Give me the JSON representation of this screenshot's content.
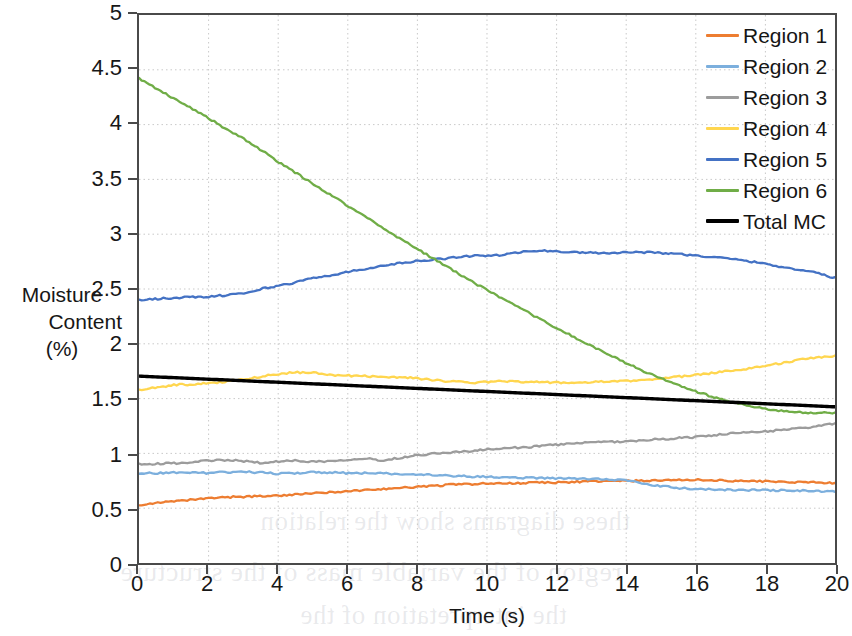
{
  "chart_data": {
    "type": "line",
    "title": "",
    "xlabel": "Time (s)",
    "ylabel": "Moisture Content (%)",
    "ylabel_lines": [
      "Moisture",
      "Content",
      "(%)"
    ],
    "xlim": [
      0,
      20
    ],
    "ylim": [
      0,
      5
    ],
    "xticks": [
      0,
      2,
      4,
      6,
      8,
      10,
      12,
      14,
      16,
      18,
      20
    ],
    "xtick_labels": [
      "0",
      "2",
      "4",
      "6",
      "8",
      "10",
      "12",
      "14",
      "16",
      "18",
      "20"
    ],
    "yticks": [
      0,
      0.5,
      1,
      1.5,
      2,
      2.5,
      3,
      3.5,
      4,
      4.5,
      5
    ],
    "ytick_labels": [
      "0",
      "0.5",
      "1",
      "1.5",
      "2",
      "2.5",
      "3",
      "3.5",
      "4",
      "4.5",
      "5"
    ],
    "grid": true,
    "grid_style": "dotted",
    "legend_position": "top-right",
    "x": [
      0,
      0.5,
      1,
      1.5,
      2,
      2.5,
      3,
      3.5,
      4,
      4.5,
      5,
      5.5,
      6,
      6.5,
      7,
      7.5,
      8,
      8.5,
      9,
      9.5,
      10,
      10.5,
      11,
      11.5,
      12,
      12.5,
      13,
      13.5,
      14,
      14.5,
      15,
      15.5,
      16,
      16.5,
      17,
      17.5,
      18,
      18.5,
      19,
      19.5,
      20
    ],
    "series": [
      {
        "name": "Region 1",
        "color": "#ED7D31",
        "values": [
          0.53,
          0.55,
          0.56,
          0.575,
          0.59,
          0.6,
          0.605,
          0.61,
          0.615,
          0.625,
          0.635,
          0.645,
          0.655,
          0.665,
          0.675,
          0.685,
          0.695,
          0.705,
          0.715,
          0.72,
          0.725,
          0.725,
          0.73,
          0.735,
          0.735,
          0.74,
          0.745,
          0.745,
          0.75,
          0.75,
          0.755,
          0.755,
          0.76,
          0.755,
          0.75,
          0.748,
          0.745,
          0.74,
          0.738,
          0.735,
          0.73
        ]
      },
      {
        "name": "Region 2",
        "color": "#7CAFDD",
        "values": [
          0.82,
          0.82,
          0.825,
          0.825,
          0.82,
          0.828,
          0.835,
          0.825,
          0.815,
          0.82,
          0.83,
          0.825,
          0.82,
          0.82,
          0.818,
          0.812,
          0.805,
          0.8,
          0.795,
          0.79,
          0.785,
          0.78,
          0.778,
          0.775,
          0.772,
          0.77,
          0.768,
          0.765,
          0.755,
          0.72,
          0.7,
          0.685,
          0.675,
          0.67,
          0.668,
          0.665,
          0.665,
          0.662,
          0.66,
          0.655,
          0.65
        ]
      },
      {
        "name": "Region 3",
        "color": "#9C9C9C",
        "values": [
          0.9,
          0.905,
          0.91,
          0.915,
          0.935,
          0.94,
          0.93,
          0.915,
          0.925,
          0.935,
          0.925,
          0.93,
          0.945,
          0.955,
          0.935,
          0.96,
          0.985,
          1.0,
          1.01,
          1.02,
          1.035,
          1.045,
          1.055,
          1.065,
          1.08,
          1.09,
          1.1,
          1.105,
          1.11,
          1.12,
          1.13,
          1.14,
          1.15,
          1.165,
          1.18,
          1.19,
          1.2,
          1.215,
          1.23,
          1.25,
          1.27
        ]
      },
      {
        "name": "Region 4",
        "color": "#FFD64F",
        "values": [
          1.58,
          1.6,
          1.625,
          1.63,
          1.64,
          1.655,
          1.68,
          1.7,
          1.725,
          1.74,
          1.735,
          1.715,
          1.71,
          1.705,
          1.7,
          1.695,
          1.685,
          1.67,
          1.655,
          1.645,
          1.65,
          1.66,
          1.655,
          1.65,
          1.645,
          1.645,
          1.65,
          1.655,
          1.66,
          1.67,
          1.685,
          1.7,
          1.715,
          1.735,
          1.755,
          1.775,
          1.8,
          1.825,
          1.855,
          1.875,
          1.89
        ]
      },
      {
        "name": "Region 5",
        "color": "#4472C4",
        "values": [
          2.4,
          2.41,
          2.42,
          2.425,
          2.43,
          2.445,
          2.46,
          2.5,
          2.53,
          2.56,
          2.6,
          2.625,
          2.655,
          2.685,
          2.715,
          2.735,
          2.755,
          2.77,
          2.785,
          2.8,
          2.805,
          2.81,
          2.84,
          2.85,
          2.845,
          2.835,
          2.83,
          2.83,
          2.835,
          2.835,
          2.83,
          2.82,
          2.805,
          2.79,
          2.775,
          2.755,
          2.73,
          2.7,
          2.675,
          2.645,
          2.6
        ]
      },
      {
        "name": "Region 6",
        "color": "#70AD47",
        "values": [
          4.42,
          4.33,
          4.24,
          4.15,
          4.06,
          3.96,
          3.87,
          3.77,
          3.66,
          3.56,
          3.46,
          3.36,
          3.26,
          3.16,
          3.06,
          2.96,
          2.865,
          2.77,
          2.675,
          2.58,
          2.49,
          2.4,
          2.315,
          2.23,
          2.145,
          2.06,
          1.98,
          1.9,
          1.825,
          1.75,
          1.685,
          1.62,
          1.565,
          1.515,
          1.47,
          1.435,
          1.405,
          1.385,
          1.375,
          1.37,
          1.37
        ]
      },
      {
        "name": "Total MC",
        "color": "#000000",
        "values": [
          1.705,
          1.698,
          1.691,
          1.684,
          1.677,
          1.67,
          1.663,
          1.656,
          1.649,
          1.642,
          1.635,
          1.628,
          1.621,
          1.614,
          1.607,
          1.6,
          1.593,
          1.586,
          1.579,
          1.572,
          1.565,
          1.558,
          1.551,
          1.544,
          1.537,
          1.53,
          1.523,
          1.516,
          1.509,
          1.502,
          1.495,
          1.488,
          1.481,
          1.474,
          1.467,
          1.46,
          1.453,
          1.446,
          1.439,
          1.432,
          1.425
        ]
      }
    ]
  },
  "legend": {
    "items": [
      {
        "label": "Region 1",
        "color": "#ED7D31"
      },
      {
        "label": "Region 2",
        "color": "#7CAFDD"
      },
      {
        "label": "Region 3",
        "color": "#9C9C9C"
      },
      {
        "label": "Region 4",
        "color": "#FFD64F"
      },
      {
        "label": "Region 5",
        "color": "#4472C4"
      },
      {
        "label": "Region 6",
        "color": "#70AD47"
      },
      {
        "label": "Total MC",
        "color": "#000000"
      }
    ]
  },
  "background_bleed": {
    "note": "faint mirrored show-through text from the reverse of the scanned page",
    "lines": [
      "these diagrams show the relation",
      "region of the variable mass of the structure",
      "the interpretation of the"
    ]
  }
}
